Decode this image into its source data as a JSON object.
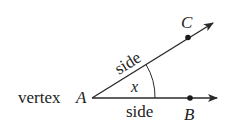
{
  "diagram": {
    "vertex_label": "vertex",
    "vertex_point": "A",
    "point_c": "C",
    "point_b": "B",
    "upper_side_label": "side",
    "lower_side_label": "side",
    "angle_label": "x",
    "line_color": "#2a2a2a"
  }
}
